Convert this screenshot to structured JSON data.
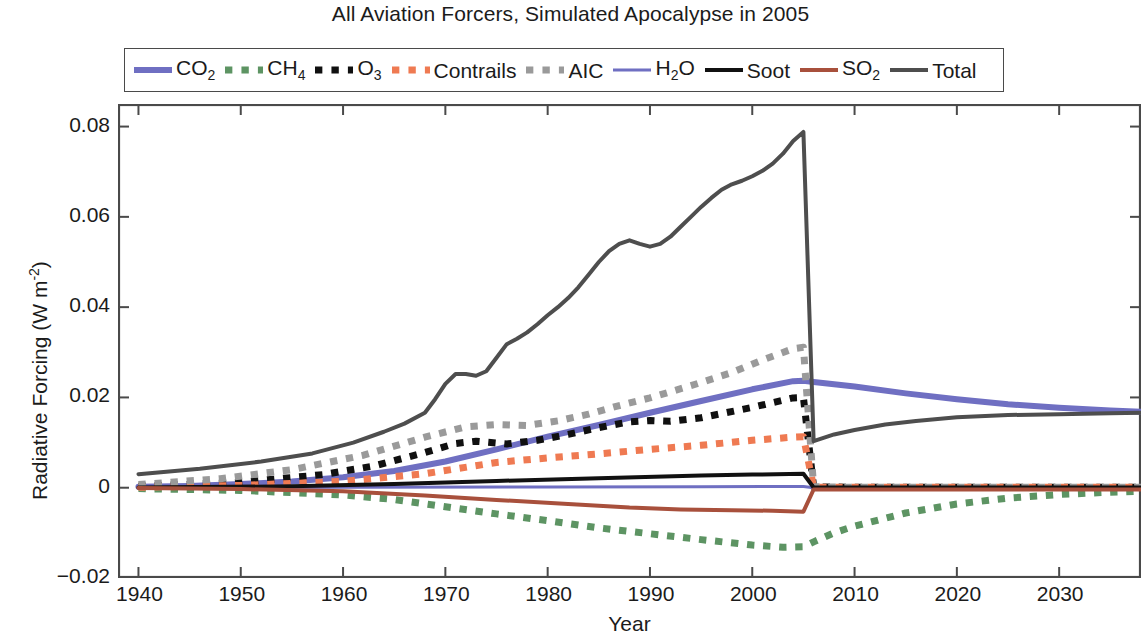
{
  "chart_data": {
    "type": "line",
    "title": "All Aviation Forcers, Simulated Apocalypse in 2005",
    "xlabel": "Year",
    "ylabel": "Radiative Forcing (W m-2)",
    "ylabel_parts": {
      "main": "Radiative Forcing (W m",
      "exponent": "-2",
      "tail": ")"
    },
    "xlim": [
      1938,
      2038
    ],
    "ylim": [
      -0.02,
      0.085
    ],
    "grid": false,
    "legend_position": "top-inside",
    "xticks": [
      1940,
      1950,
      1960,
      1970,
      1980,
      1990,
      2000,
      2010,
      2020,
      2030
    ],
    "xtick_labels": [
      "1940",
      "1950",
      "1960",
      "1970",
      "1980",
      "1990",
      "2000",
      "2010",
      "2020",
      "2030"
    ],
    "yticks": [
      -0.02,
      0,
      0.02,
      0.04,
      0.06,
      0.08
    ],
    "ytick_labels": [
      "-0.02",
      "0",
      "0.02",
      "0.04",
      "0.06",
      "0.08"
    ],
    "annotations": [
      "All emissions cease in 2005 (simulated apocalypse); every forcer drops abruptly at 2005."
    ],
    "series": [
      {
        "name": "CO2",
        "label_main": "CO",
        "label_sub": "2",
        "color": "#6f6fc2",
        "style": "solid",
        "width": 6,
        "x": [
          1940,
          1945,
          1950,
          1955,
          1960,
          1965,
          1970,
          1975,
          1980,
          1985,
          1990,
          1995,
          2000,
          2004,
          2005,
          2006,
          2008,
          2010,
          2015,
          2020,
          2025,
          2030,
          2035,
          2038
        ],
        "y": [
          0.0002,
          0.0004,
          0.0008,
          0.0014,
          0.0023,
          0.0037,
          0.0058,
          0.0085,
          0.0113,
          0.0139,
          0.0166,
          0.0192,
          0.0218,
          0.0236,
          0.0237,
          0.0234,
          0.0229,
          0.0224,
          0.0209,
          0.0196,
          0.0185,
          0.0177,
          0.0171,
          0.0168
        ]
      },
      {
        "name": "CH4",
        "label_main": "CH",
        "label_sub": "4",
        "color": "#5d9463",
        "style": "dotted",
        "width": 7,
        "x": [
          1940,
          1950,
          1960,
          1965,
          1970,
          1975,
          1980,
          1985,
          1990,
          1995,
          2000,
          2003,
          2005,
          2006,
          2008,
          2010,
          2015,
          2020,
          2025,
          2030,
          2035,
          2038
        ],
        "y": [
          -0.0002,
          -0.0006,
          -0.0016,
          -0.0026,
          -0.0042,
          -0.0058,
          -0.0073,
          -0.0089,
          -0.0102,
          -0.0115,
          -0.0127,
          -0.0132,
          -0.0131,
          -0.012,
          -0.01,
          -0.0085,
          -0.0056,
          -0.0036,
          -0.0023,
          -0.0015,
          -0.001,
          -0.0008
        ]
      },
      {
        "name": "O3",
        "label_main": "O",
        "label_sub": "3",
        "color": "#101010",
        "style": "dotted",
        "width": 7,
        "x": [
          1940,
          1950,
          1958,
          1963,
          1968,
          1971,
          1973,
          1976,
          1979,
          1982,
          1985,
          1988,
          1990,
          1992,
          1995,
          2000,
          2004,
          2005,
          2006,
          2010,
          2020,
          2030,
          2038
        ],
        "y": [
          0.0003,
          0.0012,
          0.0029,
          0.0048,
          0.0078,
          0.0098,
          0.0103,
          0.0097,
          0.0105,
          0.0118,
          0.0133,
          0.0146,
          0.0149,
          0.0147,
          0.0155,
          0.0178,
          0.0199,
          0.02,
          0.0002,
          0.0001,
          0.0001,
          0.0001,
          0.0001
        ]
      },
      {
        "name": "Contrails",
        "label_main": "Contrails",
        "label_sub": "",
        "color": "#ef7a52",
        "style": "dotted",
        "width": 7,
        "x": [
          1940,
          1950,
          1960,
          1968,
          1975,
          1980,
          1985,
          1990,
          1995,
          2000,
          2004,
          2005,
          2006,
          2010,
          2020,
          2030,
          2038
        ],
        "y": [
          0.0001,
          0.0005,
          0.0014,
          0.0031,
          0.0056,
          0.0066,
          0.0075,
          0.0085,
          0.0094,
          0.0105,
          0.0112,
          0.0113,
          0.0001,
          0.0001,
          0.0001,
          0.0001,
          0.0001
        ]
      },
      {
        "name": "AIC",
        "label_main": "AIC",
        "label_sub": "",
        "color": "#9a9a9a",
        "style": "dotted",
        "width": 7,
        "x": [
          1940,
          1948,
          1955,
          1962,
          1968,
          1972,
          1975,
          1978,
          1981,
          1984,
          1987,
          1990,
          1994,
          1998,
          2001,
          2004,
          2005,
          2006,
          2010,
          2020,
          2030,
          2038
        ],
        "y": [
          0.0007,
          0.002,
          0.004,
          0.0072,
          0.0112,
          0.0135,
          0.014,
          0.0138,
          0.0148,
          0.0163,
          0.0182,
          0.0199,
          0.0226,
          0.0255,
          0.0283,
          0.0308,
          0.0311,
          0.0002,
          0.0001,
          0.0001,
          0.0001,
          0.0001
        ]
      },
      {
        "name": "H2O",
        "label_main": "H",
        "label_sub": "2",
        "label_tail": "O",
        "color": "#6f6fc2",
        "style": "solid",
        "width": 3,
        "x": [
          1940,
          1960,
          1980,
          1995,
          2005,
          2006,
          2020,
          2038
        ],
        "y": [
          2e-05,
          8e-05,
          0.00018,
          0.00024,
          0.00028,
          1e-05,
          1e-05,
          1e-05
        ]
      },
      {
        "name": "Soot",
        "label_main": "Soot",
        "label_sub": "",
        "color": "#111111",
        "style": "solid",
        "width": 4,
        "x": [
          1940,
          1955,
          1965,
          1975,
          1985,
          1995,
          2000,
          2005,
          2006,
          2010,
          2020,
          2038
        ],
        "y": [
          5e-05,
          0.0003,
          0.0008,
          0.0015,
          0.0021,
          0.0027,
          0.0029,
          0.0031,
          5e-05,
          5e-05,
          5e-05,
          5e-05
        ]
      },
      {
        "name": "SO2",
        "label_main": "SO",
        "label_sub": "2",
        "color": "#a8503c",
        "style": "solid",
        "width": 4,
        "x": [
          1940,
          1950,
          1960,
          1968,
          1975,
          1982,
          1988,
          1993,
          1998,
          2002,
          2005,
          2006,
          2010,
          2020,
          2038
        ],
        "y": [
          -8e-05,
          -0.0003,
          -0.0008,
          -0.0017,
          -0.0027,
          -0.0036,
          -0.0044,
          -0.0048,
          -0.005,
          -0.0051,
          -0.0053,
          -0.0004,
          -0.0004,
          -0.0004,
          -0.0004
        ]
      },
      {
        "name": "Total",
        "label_main": "Total",
        "label_sub": "",
        "color": "#4e4e4e",
        "style": "solid",
        "width": 4,
        "x": [
          1940,
          1946,
          1952,
          1957,
          1961,
          1964,
          1966,
          1968,
          1969,
          1970,
          1971,
          1972,
          1973,
          1974,
          1975,
          1976,
          1977,
          1978,
          1979,
          1980,
          1981,
          1982,
          1983,
          1984,
          1985,
          1986,
          1987,
          1988,
          1989,
          1990,
          1991,
          1992,
          1993,
          1994,
          1995,
          1996,
          1997,
          1998,
          1999,
          2000,
          2001,
          2002,
          2003,
          2004,
          2005,
          2006,
          2008,
          2010,
          2013,
          2016,
          2020,
          2025,
          2030,
          2035,
          2038
        ],
        "y": [
          0.003,
          0.0042,
          0.0058,
          0.0076,
          0.01,
          0.0124,
          0.0142,
          0.0166,
          0.0196,
          0.023,
          0.0252,
          0.0252,
          0.0248,
          0.0258,
          0.0288,
          0.0318,
          0.033,
          0.0344,
          0.0362,
          0.0382,
          0.04,
          0.042,
          0.0444,
          0.0472,
          0.05,
          0.0524,
          0.054,
          0.0548,
          0.054,
          0.0534,
          0.054,
          0.0556,
          0.0578,
          0.06,
          0.0622,
          0.0642,
          0.066,
          0.0672,
          0.068,
          0.069,
          0.0702,
          0.0718,
          0.074,
          0.0768,
          0.0788,
          0.0103,
          0.0118,
          0.0128,
          0.014,
          0.0148,
          0.0156,
          0.0161,
          0.0163,
          0.0165,
          0.0166
        ]
      }
    ]
  },
  "legend": {
    "entries": [
      {
        "key": "CO2",
        "main": "CO",
        "sub": "2",
        "tail": ""
      },
      {
        "key": "CH4",
        "main": "CH",
        "sub": "4",
        "tail": ""
      },
      {
        "key": "O3",
        "main": "O",
        "sub": "3",
        "tail": ""
      },
      {
        "key": "Contrails",
        "main": "Contrails",
        "sub": "",
        "tail": ""
      },
      {
        "key": "AIC",
        "main": "AIC",
        "sub": "",
        "tail": ""
      },
      {
        "key": "H2O",
        "main": "H",
        "sub": "2",
        "tail": "O"
      },
      {
        "key": "Soot",
        "main": "Soot",
        "sub": "",
        "tail": ""
      },
      {
        "key": "SO2",
        "main": "SO",
        "sub": "2",
        "tail": ""
      },
      {
        "key": "Total",
        "main": "Total",
        "sub": "",
        "tail": ""
      }
    ]
  },
  "axis_style": {
    "frame_color": "#4a4a4a",
    "tick_color": "#4a4a4a"
  }
}
